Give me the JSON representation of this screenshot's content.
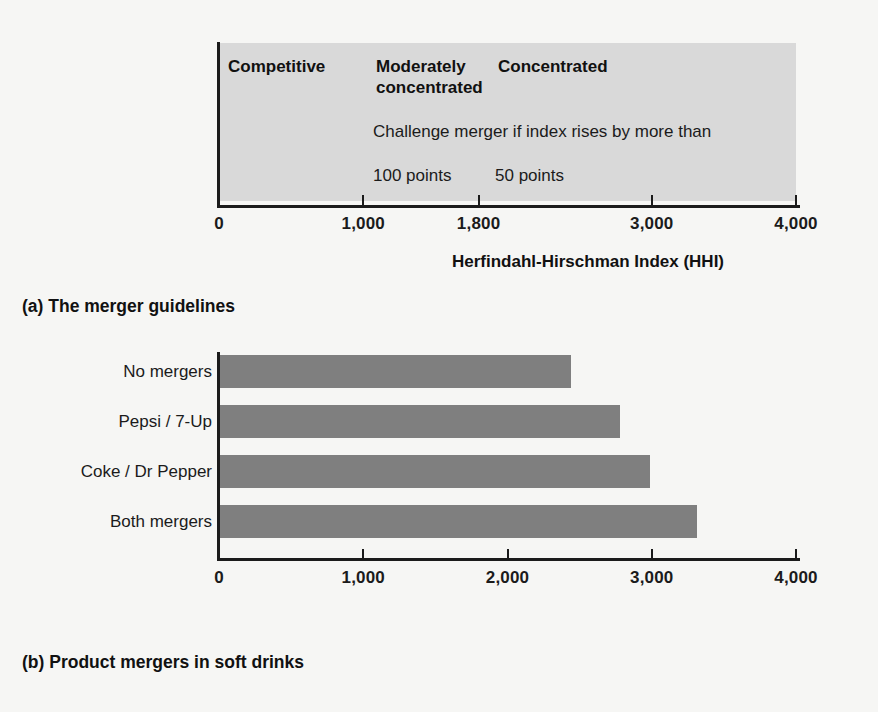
{
  "figure": {
    "background_color": "#f6f6f4",
    "bar_color": "#7f7f7f",
    "band_color": "#d9d9d9",
    "axis_color": "#1b1b1b"
  },
  "panel_a": {
    "caption": "(a) The merger guidelines",
    "axis_title": "Herfindahl-Hirschman Index (HHI)",
    "zones": [
      {
        "label": "Competitive"
      },
      {
        "label": "Moderately\nconcentrated"
      },
      {
        "label": "Concentrated"
      }
    ],
    "challenge_note": "Challenge merger if index rises by more than",
    "threshold_moderate": "100 points",
    "threshold_concentrated": "50 points",
    "ticks": [
      {
        "label": "0",
        "value": 0
      },
      {
        "label": "1,000",
        "value": 1000
      },
      {
        "label": "1,800",
        "value": 1800
      },
      {
        "label": "3,000",
        "value": 3000
      },
      {
        "label": "4,000",
        "value": 4000
      }
    ]
  },
  "panel_b": {
    "caption": "(b) Product mergers in soft drinks",
    "axis_title": "Herfindahl-Hirschman Index (HHI)",
    "ticks": [
      {
        "label": "0",
        "value": 0
      },
      {
        "label": "1,000",
        "value": 1000
      },
      {
        "label": "2,000",
        "value": 2000
      },
      {
        "label": "3,000",
        "value": 3000
      },
      {
        "label": "4,000",
        "value": 4000
      }
    ]
  },
  "chart_data": [
    {
      "type": "bar",
      "orientation": "horizontal",
      "title": "(a) The merger guidelines",
      "xlabel": "Herfindahl-Hirschman Index (HHI)",
      "ylabel": "",
      "xlim": [
        0,
        4000
      ],
      "grid": false,
      "legend": "none",
      "xticks": [
        0,
        1000,
        1800,
        3000,
        4000
      ],
      "xticklabels": [
        "0",
        "1,000",
        "1,800",
        "3,000",
        "4,000"
      ],
      "annotations": [
        {
          "text": "Competitive",
          "x_range": [
            0,
            1000
          ]
        },
        {
          "text": "Moderately concentrated",
          "x_range": [
            1000,
            1800
          ]
        },
        {
          "text": "Concentrated",
          "x_range": [
            1800,
            4000
          ]
        },
        {
          "text": "Challenge merger if index rises by more than",
          "x": 1050
        },
        {
          "text": "100 points",
          "x": 1050
        },
        {
          "text": "50 points",
          "x": 1880
        }
      ]
    },
    {
      "type": "bar",
      "orientation": "horizontal",
      "title": "(b) Product mergers in soft drinks",
      "xlabel": "Herfindahl-Hirschman Index (HHI)",
      "ylabel": "",
      "xlim": [
        0,
        4000
      ],
      "grid": false,
      "legend": "none",
      "xticks": [
        0,
        1000,
        2000,
        3000,
        4000
      ],
      "xticklabels": [
        "0",
        "1,000",
        "2,000",
        "3,000",
        "4,000"
      ],
      "categories": [
        "No mergers",
        "Pepsi / 7-Up",
        "Coke / Dr Pepper",
        "Both mergers"
      ],
      "values": [
        2430,
        2770,
        2980,
        3310
      ]
    }
  ]
}
